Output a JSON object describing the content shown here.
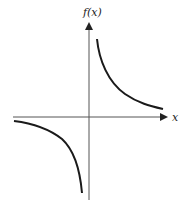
{
  "diagram": {
    "type": "function-graph",
    "y_axis_label": "f(x)",
    "x_axis_label": "x",
    "curve": "reciprocal hyperbola (f(x) = k/x, k > 0)",
    "colors": {
      "axes": "#555555",
      "curve": "#1a1a1a",
      "background": "#ffffff"
    }
  }
}
